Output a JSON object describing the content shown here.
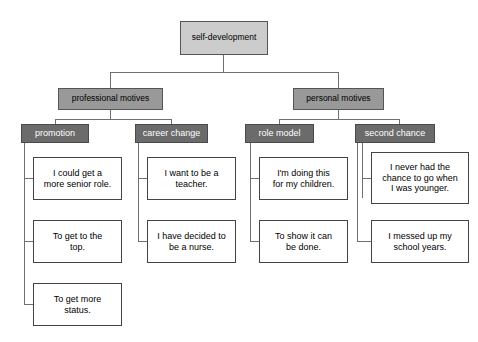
{
  "diagram": {
    "type": "tree-mind-map",
    "colors": {
      "root_fill": "#cccccc",
      "category_fill": "#999999",
      "subcategory_fill": "#6b6b6b",
      "leaf_fill": "#ffffff",
      "border": "#555555",
      "connector": "#6f6f6f",
      "subcategory_text": "#ffffff",
      "text": "#000000"
    },
    "root": {
      "label": "self-development"
    },
    "categories": [
      {
        "label": "professional motives"
      },
      {
        "label": "personal motives"
      }
    ],
    "subcategories": [
      {
        "label": "promotion"
      },
      {
        "label": "career change"
      },
      {
        "label": "role model"
      },
      {
        "label": "second chance"
      }
    ],
    "leaves": {
      "promotion": [
        {
          "lines": [
            "I could get a",
            "more senior role."
          ]
        },
        {
          "lines": [
            "To get to the",
            "top."
          ]
        },
        {
          "lines": [
            "To get more",
            "status."
          ]
        }
      ],
      "career_change": [
        {
          "lines": [
            "I want to be a",
            "teacher."
          ]
        },
        {
          "lines": [
            "I have decided to",
            "be a nurse."
          ]
        }
      ],
      "role_model": [
        {
          "lines": [
            "I'm doing this",
            "for my children."
          ]
        },
        {
          "lines": [
            "To show it can",
            "be done."
          ]
        }
      ],
      "second_chance": [
        {
          "lines": [
            "I never had the",
            "chance to go when",
            "I was younger."
          ]
        },
        {
          "lines": [
            "I messed up my",
            "school years."
          ]
        }
      ]
    }
  }
}
